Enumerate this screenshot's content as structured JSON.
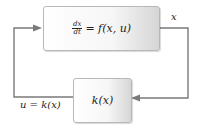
{
  "diagram": {
    "blocks": {
      "plant": {
        "lhs_numerator": "dx",
        "lhs_denominator": "dt",
        "rhs": "= f(x, u)"
      },
      "controller": {
        "text": "k(x)"
      }
    },
    "signals": {
      "state": "x",
      "control": "u = k(x)"
    },
    "colors": {
      "line": "#7a7a7a",
      "box_border": "#b8b8b8",
      "text": "#222222"
    }
  }
}
